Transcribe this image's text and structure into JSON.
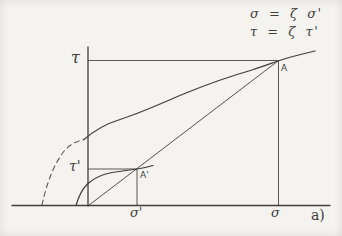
{
  "figure": {
    "equations": {
      "line1": "σ = ζ σ'",
      "line2": "τ = ζ τ'"
    },
    "axis_labels": {
      "tau": "τ",
      "tau_prime": "τ'",
      "sigma": "σ",
      "sigma_prime": "σ'"
    },
    "points": {
      "a": "A",
      "a_prime": "A'"
    },
    "panel_label": "a)",
    "colors": {
      "ink": "#3f3e3c",
      "paper": "#f4f3ef"
    }
  }
}
